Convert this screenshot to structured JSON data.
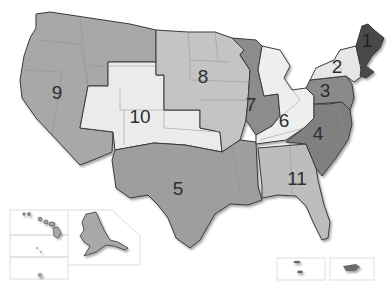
{
  "map": {
    "title": "",
    "colors": {
      "region_1": "#4a4a4a",
      "region_2": "#e6e6e6",
      "region_3": "#8a8a8a",
      "region_4": "#808080",
      "region_5": "#9e9e9e",
      "region_6": "#eeeeee",
      "region_7": "#8c8c8c",
      "region_8": "#c4c4c4",
      "region_9": "#a8a8a8",
      "region_10": "#ebebeb",
      "region_11": "#bdbdbd",
      "border": "#3a3a3a"
    },
    "regions": [
      {
        "id": "1",
        "label": "1"
      },
      {
        "id": "2",
        "label": "2"
      },
      {
        "id": "3",
        "label": "3"
      },
      {
        "id": "4",
        "label": "4"
      },
      {
        "id": "5",
        "label": "5"
      },
      {
        "id": "6",
        "label": "6"
      },
      {
        "id": "7",
        "label": "7"
      },
      {
        "id": "8",
        "label": "8"
      },
      {
        "id": "9",
        "label": "9"
      },
      {
        "id": "10",
        "label": "10"
      },
      {
        "id": "11",
        "label": "11"
      }
    ],
    "insets": [
      "Hawaii",
      "Alaska",
      "Guam",
      "American Samoa",
      "Virgin Islands",
      "Puerto Rico"
    ]
  }
}
